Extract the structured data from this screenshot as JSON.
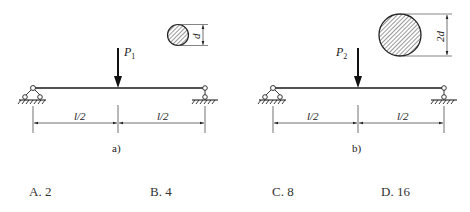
{
  "figures": [
    {
      "id": "a",
      "caption": "a)",
      "load_label": "P",
      "load_subscript": "1",
      "section_label": "d",
      "span_labels": [
        "l/2",
        "l/2"
      ]
    },
    {
      "id": "b",
      "caption": "b)",
      "load_label": "P",
      "load_subscript": "2",
      "section_label": "2d",
      "span_labels": [
        "l/2",
        "l/2"
      ]
    }
  ],
  "options": [
    {
      "letter": "A.",
      "value": "2"
    },
    {
      "letter": "B.",
      "value": "4"
    },
    {
      "letter": "C.",
      "value": "8"
    },
    {
      "letter": "D.",
      "value": "16"
    }
  ],
  "colors": {
    "line": "#1a1a1a",
    "text": "#333333",
    "background": "#ffffff"
  }
}
